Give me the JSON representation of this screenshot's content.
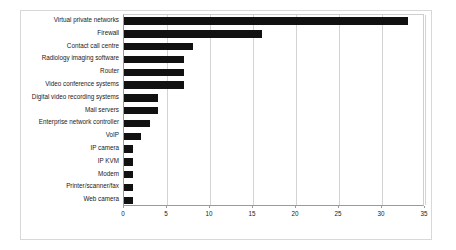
{
  "chart_data": {
    "type": "bar",
    "orientation": "horizontal",
    "title": "",
    "xlabel": "",
    "ylabel": "",
    "xlim": [
      0,
      35
    ],
    "xticks": [
      0,
      5,
      10,
      15,
      20,
      25,
      30,
      35
    ],
    "grid": true,
    "legend": false,
    "bar_color": "#111111",
    "categories": [
      "Virtual private networks",
      "Firewall",
      "Contact call centre",
      "Radiology imaging software",
      "Router",
      "Video conference systems",
      "Digital video recording systems",
      "Mail servers",
      "Enterprise network controller",
      "VoIP",
      "IP camera",
      "IP KVM",
      "Modem",
      "Printer/scanner/fax",
      "Web camera"
    ],
    "values": [
      33,
      16,
      8,
      7,
      7,
      7,
      4,
      4,
      3,
      2,
      1,
      1,
      1,
      1,
      1
    ]
  }
}
